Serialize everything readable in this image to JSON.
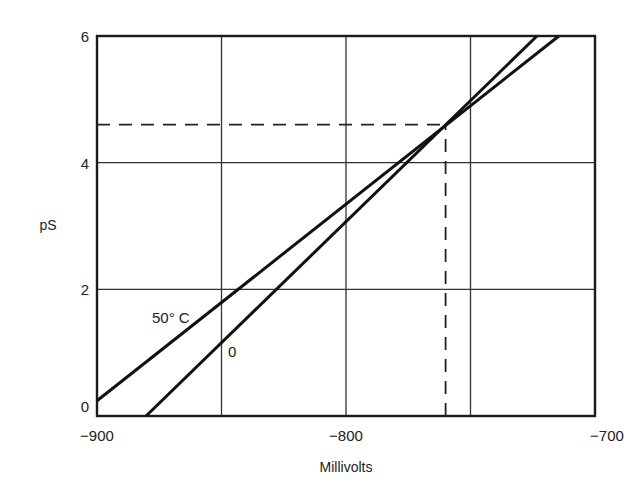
{
  "chart_data": {
    "type": "line",
    "title": "",
    "xlabel": "Millivolts",
    "ylabel": "pS",
    "xlim": [
      -900,
      -700
    ],
    "ylim": [
      0,
      6
    ],
    "grid": true,
    "legend": "inline curve labels",
    "x_ticks": [
      -900,
      -800,
      -700
    ],
    "x_tick_labels": [
      "−900",
      "−800",
      "−700"
    ],
    "x_gridlines": [
      -850,
      -800,
      -750
    ],
    "y_ticks": [
      0,
      2,
      4,
      6
    ],
    "y_tick_labels": [
      "0",
      "2",
      "4",
      "6"
    ],
    "y_gridlines": [
      2,
      4
    ],
    "series": [
      {
        "name": "0",
        "label": "0",
        "x": [
          -880.3,
          -723.3
        ],
        "y": [
          0,
          6
        ]
      },
      {
        "name": "50° C",
        "label": "50° C",
        "x": [
          -900,
          -714.5
        ],
        "y": [
          0.24,
          6
        ]
      }
    ],
    "annotations": [
      {
        "type": "dashed-hline",
        "y": 4.6,
        "x_from": -900,
        "x_to": -760
      },
      {
        "type": "dashed-vline",
        "x": -760,
        "y_from": 0,
        "y_to": 4.6
      }
    ]
  }
}
